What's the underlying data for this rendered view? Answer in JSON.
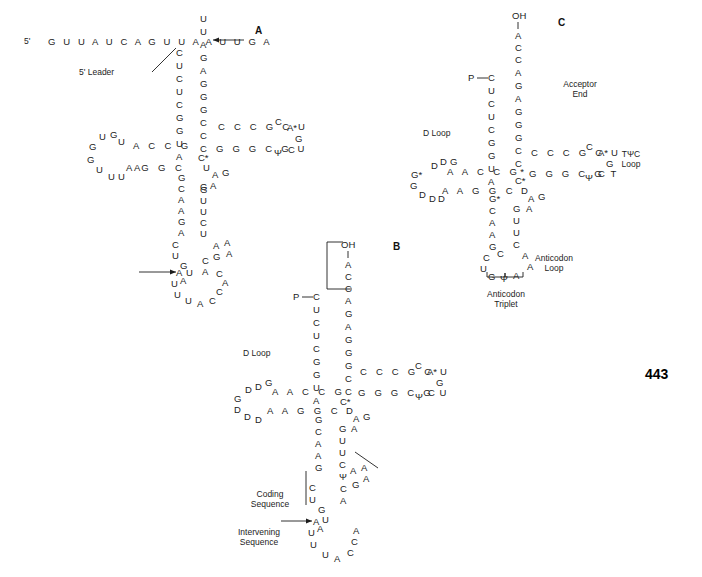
{
  "figure": {
    "page_number": "443",
    "panels": [
      {
        "id": "A",
        "label": "A"
      },
      {
        "id": "B",
        "label": "B"
      },
      {
        "id": "C",
        "label": "C"
      }
    ]
  },
  "panelA": {
    "label": "A",
    "leader_prefix": "5'",
    "leader_sequence": "G U U A U C A G U U A A U U G A",
    "leader_label": "5' Leader",
    "acceptor_left_stem": [
      "C",
      "U",
      "C",
      "U",
      "C",
      "G",
      "G",
      "U",
      "A"
    ],
    "acceptor_right_stem": [
      "A",
      "G",
      "A",
      "G",
      "G",
      "G",
      "C",
      "C",
      "C"
    ],
    "acceptor_top_tail": [
      "U",
      "U"
    ],
    "dloop_top_stem": "A C C G",
    "dloop_bottom_stem": "A G G C",
    "dloop_letters": [
      "U",
      "G",
      "U",
      "A",
      "G",
      "G",
      "U",
      "U",
      "U",
      "A"
    ],
    "tpsi_top_strand": "C C C G C U",
    "tpsi_bottom_strand": "G G G C G U",
    "tpsi_loop_letters": [
      "C",
      "A*",
      "G",
      "C",
      "Ψ"
    ],
    "hinge_letters": [
      "C*",
      "U",
      "A",
      "G",
      "G",
      "A",
      "A"
    ],
    "anticodon_left_stem": [
      "G",
      "C",
      "A",
      "A",
      "G",
      "A"
    ],
    "anticodon_right_stem": [
      "G",
      "U",
      "U",
      "C",
      "U"
    ],
    "anticodon_left_lower": [
      "C",
      "U",
      "G",
      "U",
      "A"
    ],
    "anticodon_right_lower": [
      "A",
      "A",
      "A",
      "G",
      "C",
      "A",
      "U"
    ],
    "bottom_loop": [
      "A",
      "U",
      "U",
      "U",
      "A",
      "C",
      "C",
      "A",
      "C",
      "U"
    ]
  },
  "panelB": {
    "label": "B",
    "acceptor_end_oh": "OH",
    "acceptor_end_tail": [
      "A",
      "C",
      "C"
    ],
    "phosphate_label": "P",
    "acceptor_left_stem": [
      "C",
      "U",
      "C",
      "U",
      "C",
      "G",
      "G",
      "U",
      "A"
    ],
    "acceptor_right_stem": [
      "A",
      "G",
      "A",
      "G",
      "G",
      "G",
      "C",
      "C",
      "C"
    ],
    "dloop_label": "D Loop",
    "dloop_top_stem": "A A C C G",
    "dloop_bottom_stem": "A A G G C",
    "dloop_letters": [
      "D",
      "G",
      "D",
      "G",
      "G",
      "D",
      "D",
      "D"
    ],
    "tpsi_top_strand": "C C C G C U",
    "tpsi_bottom_strand": "G G G C G U",
    "tpsi_loop_letters": [
      "C",
      "A*",
      "G",
      "C",
      "Ψ"
    ],
    "hinge_letters": [
      "C*",
      "D",
      "A",
      "G",
      "A",
      "G"
    ],
    "anticodon_left_stem": [
      "G",
      "C",
      "A",
      "A",
      "G",
      "A"
    ],
    "anticodon_right_stem": [
      "G",
      "U",
      "U",
      "C",
      "Ψ"
    ],
    "anticodon_right_loop": [
      "A",
      "A",
      "A",
      "G",
      "C",
      "A",
      "U"
    ],
    "anticodon_left_lower": [
      "C",
      "U",
      "G",
      "U",
      "A"
    ],
    "bottom_loop": [
      "A",
      "U",
      "U",
      "U",
      "A",
      "C",
      "C",
      "A",
      "C"
    ],
    "coding_sequence_label": "Coding\nSequence",
    "intervening_sequence_label": "Intervening\nSequence"
  },
  "panelC": {
    "label": "C",
    "acceptor_end_oh": "OH",
    "acceptor_end_tail": [
      "A",
      "C",
      "C"
    ],
    "acceptor_end_label": "Acceptor\nEnd",
    "phosphate_label": "P",
    "acceptor_left_stem": [
      "C",
      "U",
      "C",
      "U",
      "C",
      "G",
      "G",
      "U",
      "A"
    ],
    "acceptor_right_stem": [
      "A",
      "G",
      "A",
      "G",
      "G",
      "G",
      "C",
      "C",
      "C"
    ],
    "dloop_label": "D Loop",
    "dloop_top_stem": "A A C C G*",
    "dloop_bottom_stem": "A A G G C",
    "dloop_letters": [
      "D",
      "D",
      "G",
      "G*",
      "G",
      "D",
      "D",
      "D"
    ],
    "tpsi_label": "TΨC\nLoop",
    "tpsi_top_strand": "C C C G C U",
    "tpsi_bottom_strand": "G G G C G T",
    "tpsi_loop_letters": [
      "C",
      "A*",
      "G",
      "C",
      "Ψ"
    ],
    "hinge_letters": [
      "C*",
      "D",
      "A",
      "G",
      "A",
      "G"
    ],
    "anticodon_left_stem": [
      "G*",
      "C",
      "A",
      "A",
      "G",
      "A"
    ],
    "anticodon_right_stem": [
      "G",
      "U",
      "U",
      "C",
      "Ψ"
    ],
    "anticodon_loop_label": "Anticodon\nLoop",
    "anticodon_loop_letters": [
      "A",
      "A",
      "C",
      "A",
      "U",
      "G",
      "Ψ",
      "A"
    ],
    "anticodon_triplet_label": "Anticodon\nTriplet",
    "anticodon_left_lower": [
      "C",
      "U"
    ]
  }
}
